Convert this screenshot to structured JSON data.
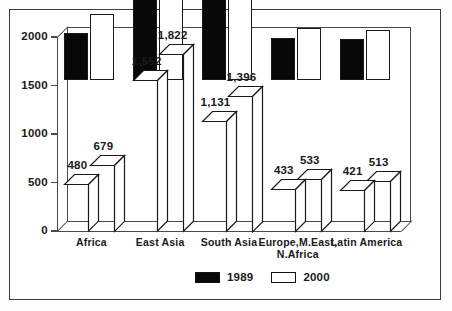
{
  "chart_data": {
    "type": "bar",
    "title": "",
    "subtitle": "",
    "xlabel": "",
    "ylabel": "",
    "ylim": [
      0,
      2000
    ],
    "yticks": [
      0,
      500,
      1000,
      1500,
      2000
    ],
    "ytick_labels": [
      "0",
      "500",
      "1000",
      "1500",
      "2000"
    ],
    "grid": false,
    "legend_position": "bottom-center",
    "style": "3d-column",
    "categories": [
      "Africa",
      "East Asia",
      "South Asia",
      "Europe,M.East, N.Africa",
      "Latin America"
    ],
    "category_label_lines": [
      [
        "Africa"
      ],
      [
        "East Asia"
      ],
      [
        "South Asia"
      ],
      [
        "Europe,M.East,",
        "N.Africa"
      ],
      [
        "Latin America"
      ]
    ],
    "series": [
      {
        "name": "1989",
        "color": "#080808",
        "values": [
          480,
          1552,
          1131,
          433,
          421
        ],
        "value_labels": [
          "480",
          "1,552",
          "1,131",
          "433",
          "421"
        ]
      },
      {
        "name": "2000",
        "color": "#ffffff",
        "values": [
          679,
          1822,
          1396,
          533,
          513
        ],
        "value_labels": [
          "679",
          "1,822",
          "1,396",
          "533",
          "513"
        ]
      }
    ]
  },
  "legend": {
    "entries": [
      {
        "label": "1989",
        "swatch": "dark"
      },
      {
        "label": "2000",
        "swatch": "light"
      }
    ]
  },
  "colors": {
    "series_1989": "#080808",
    "series_2000": "#ffffff",
    "axis": "#4a4a4a",
    "text": "#1a1a1a",
    "frame": "#3c3c3c",
    "background": "#fdfdfd"
  }
}
